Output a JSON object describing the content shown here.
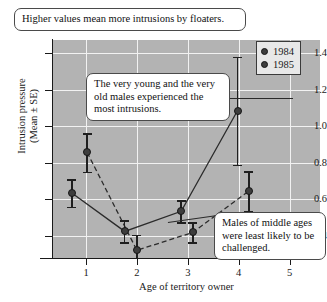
{
  "chart_data": {
    "type": "scatter",
    "title": "",
    "xlabel": "Age of territory owner",
    "ylabel": "Intrusion pressure\n(Mean ± SE)",
    "ylabel_line1": "Intrusion pressure",
    "ylabel_line2": "(Mean ± SE)",
    "xlim": [
      0.35,
      5.6
    ],
    "ylim": [
      0.28,
      1.47
    ],
    "xticks": [
      1,
      2,
      3,
      4,
      5
    ],
    "xtick_labels": [
      "1",
      "2",
      "3",
      "4",
      "5"
    ],
    "yticks": [
      0.4,
      0.6,
      0.8,
      1.0,
      1.2,
      1.4
    ],
    "ytick_labels": [
      "0.4",
      "0.6",
      "0.8",
      "1.0",
      "1.2",
      "1.4"
    ],
    "grid": true,
    "grid_color": "#f2f2f2",
    "plot_background": "#b3b3b3",
    "legend_position": "top-right",
    "series": [
      {
        "name": "1984",
        "linestyle": "solid",
        "marker": "circle",
        "color": "#3d3d3d",
        "points": [
          {
            "x": 0.72,
            "y": 0.635,
            "err": 0.075
          },
          {
            "x": 1.76,
            "y": 0.425,
            "err": 0.06
          },
          {
            "x": 2.87,
            "y": 0.535,
            "err": 0.06
          },
          {
            "x": 3.98,
            "y": 1.085,
            "err": 0.295
          }
        ]
      },
      {
        "name": "1985",
        "linestyle": "dashed",
        "marker": "circle",
        "color": "#3d3d3d",
        "points": [
          {
            "x": 1.02,
            "y": 0.857,
            "err": 0.105
          },
          {
            "x": 2.0,
            "y": 0.322,
            "err": 0.085
          },
          {
            "x": 3.1,
            "y": 0.42,
            "err": 0.055
          },
          {
            "x": 4.2,
            "y": 0.645,
            "err": 0.11
          }
        ]
      }
    ]
  },
  "legend": {
    "entries": [
      {
        "label": "1984"
      },
      {
        "label": "1985"
      }
    ]
  },
  "callouts": {
    "top": "Higher values mean more intrusions by floaters.",
    "middle": "The very young and the very old males experienced the most intrusions.",
    "bottom": "Males of middle ages were least likely to be challenged."
  }
}
